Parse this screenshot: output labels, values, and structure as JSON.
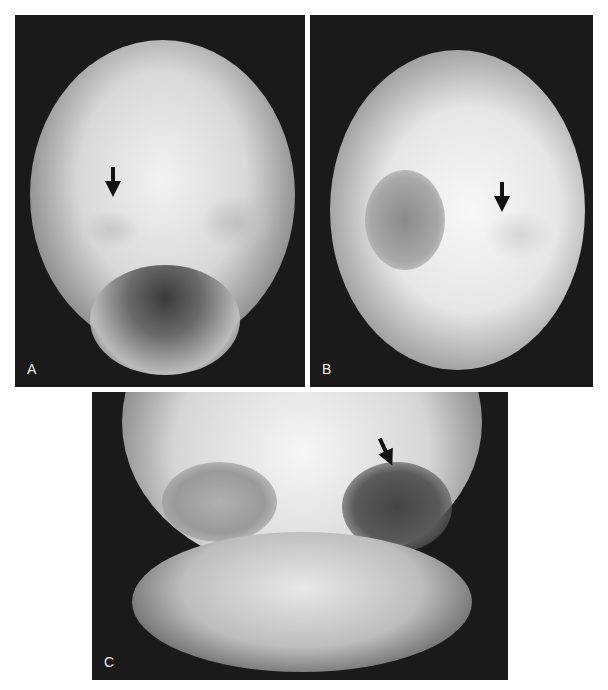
{
  "figure": {
    "panels": [
      {
        "id": "A",
        "label": "A",
        "description": "Frontal skull radiograph with arrow at left orbital roof"
      },
      {
        "id": "B",
        "label": "B",
        "description": "Frontal skull radiograph with arrow at right orbit"
      },
      {
        "id": "C",
        "label": "C",
        "description": "Frontal radiograph of orbits/sinuses with arrow at left orbital margin"
      }
    ],
    "colors": {
      "background": "#ffffff",
      "film_dark": "#1a1a1a",
      "bone_bright": "#f4f4f4",
      "arrow": "#111111"
    }
  }
}
